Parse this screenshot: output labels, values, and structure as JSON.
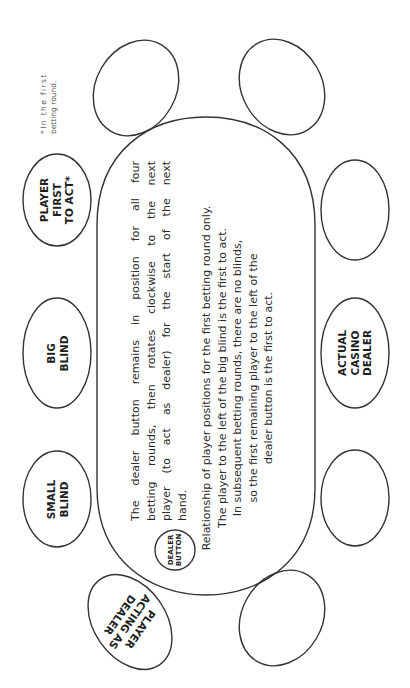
{
  "diagram": {
    "table": {
      "shape": "stadium",
      "stroke_color": "#333333"
    },
    "seats": [
      {
        "id": "player-first-to-act",
        "label_lines": [
          "PLAYER",
          "FIRST",
          "TO ACT*"
        ]
      },
      {
        "id": "big-blind",
        "label_lines": [
          "BIG",
          "BLIND"
        ]
      },
      {
        "id": "small-blind",
        "label_lines": [
          "SMALL",
          "BLIND"
        ]
      },
      {
        "id": "player-acting-as-dealer",
        "label_lines": [
          "PLAYER",
          "ACTING AS",
          "DEALER"
        ]
      },
      {
        "id": "actual-casino-dealer",
        "label_lines": [
          "ACTUAL",
          "CASINO",
          "DEALER"
        ]
      },
      {
        "id": "empty-seat-top-left",
        "label_lines": []
      },
      {
        "id": "empty-seat-top-right",
        "label_lines": []
      },
      {
        "id": "empty-seat-right-upper",
        "label_lines": []
      },
      {
        "id": "empty-seat-right-lower",
        "label_lines": []
      },
      {
        "id": "empty-seat-bottom-right",
        "label_lines": []
      }
    ],
    "dealer_button": {
      "label_lines": [
        "DEALER",
        "BUTTON"
      ]
    },
    "paragraph_1": {
      "lines": [
        "The dealer button remains in position for all four",
        "betting rounds, then rotates clockwise to the next",
        "player (to act as dealer) for the start of the next",
        "hand."
      ]
    },
    "paragraph_2": {
      "lines": [
        "Relationship of player positions for the first betting round only.",
        "The player to the left of the big blind is the first to act.",
        "In subsequent betting rounds, there are no blinds,",
        "so the first remaining player to the left of the",
        "dealer button is the first to act."
      ]
    },
    "footnote": {
      "lines": [
        "*In the first",
        "betting round."
      ]
    }
  }
}
